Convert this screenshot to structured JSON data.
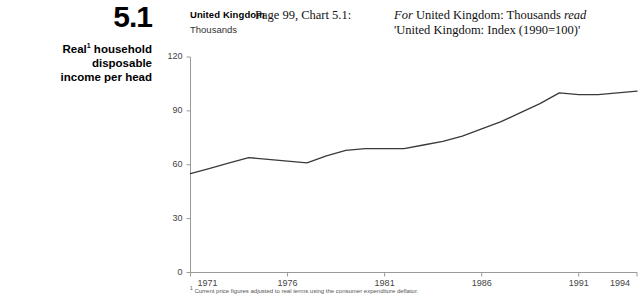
{
  "left_block": {
    "chart_number": "5.1",
    "title_line1": "Real",
    "title_footnote_marker": "1",
    "title_line1_rest": " household disposable",
    "title_line2": "income per head"
  },
  "chart_header": {
    "region": "United Kingdom",
    "unit": "Thousands"
  },
  "erratum": {
    "reference": "Page 99, Chart 5.1:",
    "line1_prefix": "For",
    "line1_rest": " United Kingdom: Thousands ",
    "line1_emphasis": "read",
    "line2": "'United Kingdom: Index (1990=100)'"
  },
  "footnote": {
    "marker": "1",
    "text": " Current price figures adjusted to real terms using the consumer expenditure deflator."
  },
  "chart_data": {
    "type": "line",
    "subtitle": "United Kingdom",
    "xlabel": "",
    "ylabel": "Thousands",
    "ylim": [
      0,
      120
    ],
    "xlim": [
      1971,
      1994
    ],
    "yticks": [
      0,
      30,
      60,
      90,
      120
    ],
    "xticks": [
      1971,
      1976,
      1981,
      1986,
      1991,
      1994
    ],
    "grid": false,
    "legend": false,
    "line_color": "#3a3a3a",
    "series": [
      {
        "name": "Real household disposable income per head",
        "x": [
          1971,
          1972,
          1973,
          1974,
          1975,
          1976,
          1977,
          1978,
          1979,
          1980,
          1981,
          1982,
          1983,
          1984,
          1985,
          1986,
          1987,
          1988,
          1989,
          1990,
          1991,
          1992,
          1993,
          1994
        ],
        "values": [
          55,
          58,
          61,
          64,
          63,
          62,
          61,
          65,
          68,
          69,
          69,
          69,
          71,
          73,
          76,
          80,
          84,
          89,
          94,
          100,
          99,
          99,
          100,
          101
        ]
      }
    ]
  }
}
